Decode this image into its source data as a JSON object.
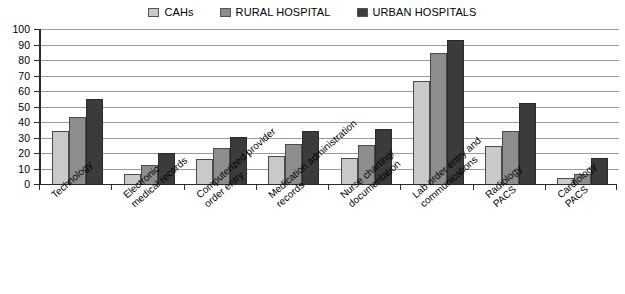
{
  "chart_data": {
    "type": "bar",
    "title": "",
    "xlabel": "",
    "ylabel": "",
    "ylim": [
      0,
      100
    ],
    "yticks": [
      0,
      10,
      20,
      30,
      40,
      50,
      60,
      70,
      80,
      90,
      100
    ],
    "grid": true,
    "legend_position": "top-center",
    "categories": [
      "Technology",
      "Electronic\nmedical records",
      "Computerized provider\norder entry",
      "Medication administration\nrecords",
      "Nurse charting/\ndocumentation",
      "Lab order entry and\ncommunications",
      "Radiology\nPACS",
      "Cardiology\nPACS"
    ],
    "series": [
      {
        "name": "CAHs",
        "color": "#c9c9c9",
        "values": [
          34.5,
          6.5,
          16,
          18,
          16.5,
          66.5,
          24.5,
          4
        ]
      },
      {
        "name": "RURAL HOSPITAL",
        "color": "#8d8d8d",
        "values": [
          43,
          12,
          23,
          26,
          25,
          84.5,
          34.5,
          6.5
        ]
      },
      {
        "name": "URBAN HOSPITALS",
        "color": "#3b3b3b",
        "values": [
          55,
          20,
          30.5,
          34.5,
          35.5,
          93,
          52,
          17
        ]
      }
    ]
  }
}
